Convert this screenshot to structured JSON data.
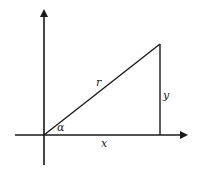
{
  "diagram": {
    "type": "right-triangle-polar-coordinates",
    "labels": {
      "hypotenuse": "r",
      "vertical_side": "y",
      "horizontal_side": "x",
      "angle": "α"
    },
    "colors": {
      "stroke": "#1a1a1a",
      "background": "#ffffff",
      "text": "#222222"
    }
  }
}
